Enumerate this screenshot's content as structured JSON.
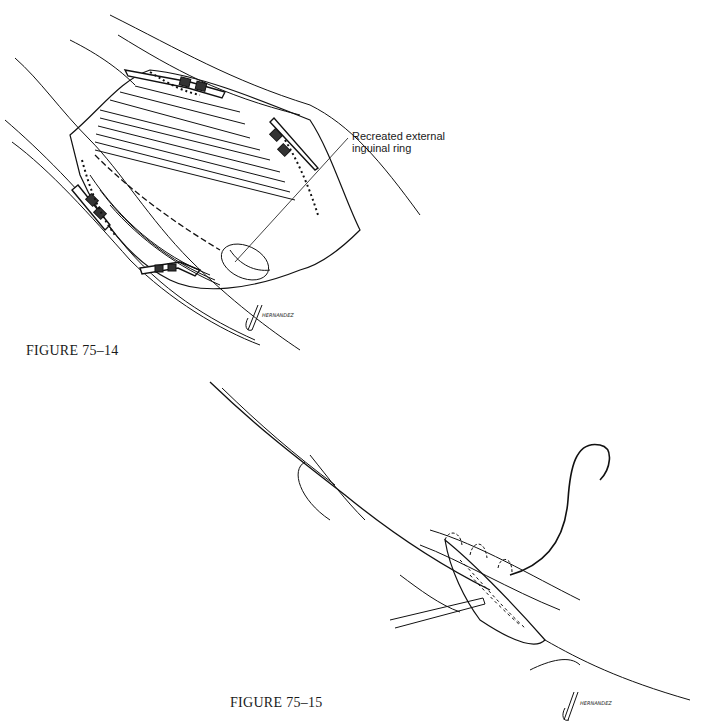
{
  "figures": [
    {
      "label": "FIGURE 75–14",
      "callout": {
        "line1": "Recreated external",
        "line2": "inguinal ring"
      },
      "signature": "HERNANDEZ"
    },
    {
      "label": "FIGURE 75–15",
      "signature": "HERNANDEZ"
    }
  ]
}
